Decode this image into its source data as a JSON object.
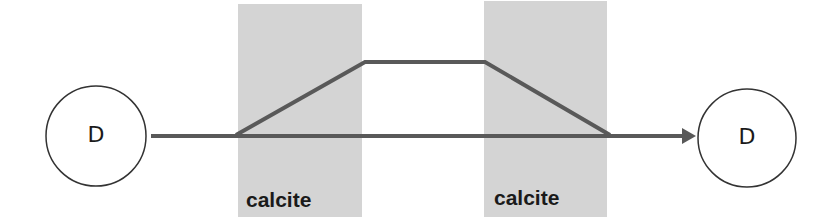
{
  "diagram": {
    "nodes": [
      {
        "id": "left",
        "label": "D"
      },
      {
        "id": "right",
        "label": "D"
      }
    ],
    "regions": [
      {
        "label": "calcite"
      },
      {
        "label": "calcite"
      }
    ],
    "colors": {
      "region_fill": "#d4d4d4",
      "line": "#595959",
      "node_stroke": "#333333",
      "text": "#1a1a1a"
    }
  }
}
